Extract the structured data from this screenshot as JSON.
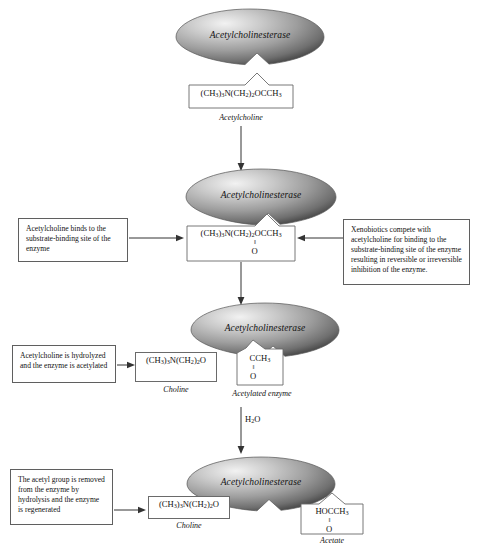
{
  "diagram": {
    "enzyme_label": "Acetylcholinesterase",
    "colors": {
      "enzyme_light": "#efefef",
      "enzyme_mid": "#9a9a9a",
      "enzyme_dark": "#4a4a4a",
      "box_border": "#6a6a6a",
      "line": "#333333",
      "background": "#ffffff"
    }
  },
  "stages": {
    "stage1": {
      "enzyme_label": "Acetylcholinesterase",
      "substrate_formula_main": "(CH3)3N(CH2)2OCCH3",
      "substrate_caption": "Acetylcholine"
    },
    "stage2": {
      "enzyme_label": "Acetylcholinesterase",
      "substrate_formula_main": "(CH3)3N(CH2)2OCCH3",
      "substrate_bond": "II",
      "substrate_oxygen": "O",
      "left_note": "Acetylcholine binds to the substrate-binding site of the enzyme",
      "right_note": "Xenobiotics compete with acetylcholine for binding to the substrate-binding site of the enzyme resulting in reversible or irreversible inhibition of the enzyme."
    },
    "stage3": {
      "enzyme_label": "Acetylcholinesterase",
      "left_note": "Acetylcholine is hydrolyzed and the enzyme is acetylated",
      "choline_formula": "(CH3)3N(CH2)2O",
      "choline_caption": "Choline",
      "acetyl_formula_main": "CCH3",
      "acetyl_bond": "II",
      "acetyl_oxygen": "O",
      "acetyl_caption": "Acetylated enzyme",
      "water_label": "H2O"
    },
    "stage4": {
      "enzyme_label": "Acetylcholinesterase",
      "left_note": "The acetyl group is removed from the enzyme by hydrolysis and the enzyme is regenerated",
      "choline_formula": "(CH3)3N(CH2)2O",
      "choline_caption": "Choline",
      "acetate_formula_main": "HOCCH3",
      "acetate_bond": "II",
      "acetate_oxygen": "O",
      "acetate_caption": "Acetate"
    }
  }
}
